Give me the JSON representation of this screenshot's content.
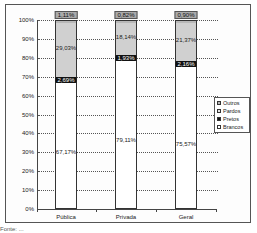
{
  "chart_data": {
    "type": "bar",
    "stacked": true,
    "title": "",
    "xlabel": "",
    "ylabel": "",
    "ylim": [
      0,
      100
    ],
    "yticks": [
      "0%",
      "10%",
      "20%",
      "30%",
      "40%",
      "50%",
      "60%",
      "70%",
      "80%",
      "90%",
      "100%"
    ],
    "categories": [
      "Pública",
      "Privada",
      "Geral"
    ],
    "series": [
      {
        "name": "Brancos",
        "values": [
          67.17,
          79.11,
          75.57
        ],
        "labels": [
          "67,17%",
          "79,11%",
          "75,57%"
        ],
        "color": "#ffffff"
      },
      {
        "name": "Pretos",
        "values": [
          2.69,
          1.93,
          2.16
        ],
        "labels": [
          "2,69%",
          "1,93%",
          "2,16%"
        ],
        "color": "#222222"
      },
      {
        "name": "Pardos",
        "values": [
          29.03,
          18.14,
          21.37
        ],
        "labels": [
          "29,03%",
          "18,14%",
          "21,37%"
        ],
        "color": "#d0d0d0"
      },
      {
        "name": "Outros",
        "values": [
          1.11,
          0.82,
          0.9
        ],
        "labels": [
          "1,11%",
          "0,82%",
          "0,90%"
        ],
        "color": "#b8b8b8"
      }
    ],
    "legend": {
      "position": "right",
      "entries": [
        "Outros",
        "Pardos",
        "Pretos",
        "Brancos"
      ]
    },
    "grid": true
  },
  "footer": {
    "text": "Fonte: ..."
  }
}
